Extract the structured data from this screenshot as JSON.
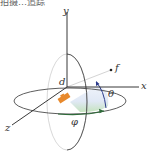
{
  "title": "拍摄…追踪",
  "diagram": {
    "type": "spherical-coordinates",
    "axes": {
      "x_label": "x",
      "y_label": "y",
      "z_label": "z"
    },
    "point_label": "f",
    "distance_label": "d",
    "theta_label": "θ",
    "phi_label": "φ",
    "colors": {
      "axis": "#222222",
      "circle": "#555555",
      "object": "#e8892c",
      "theta_arrow": "#2b3a8a",
      "phi_arrow": "#2f6b3a",
      "hemisphere_fill": "#dde6f4",
      "hemisphere_green": "#cfe6c8",
      "ray": "#d9d9d9"
    }
  }
}
